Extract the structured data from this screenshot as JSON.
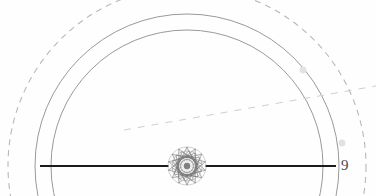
{
  "page": {
    "width": 376,
    "height": 196,
    "background_color": "#fefefe",
    "page_number": "9",
    "page_number_position": {
      "x": 341,
      "y": 158
    },
    "page_number_color": "#4a4a4a"
  },
  "figure": {
    "name": "concentric-circle-geometric-construction",
    "center": {
      "x": 187,
      "y": 166
    },
    "colors": {
      "dashed_outer": "#b8b8b8",
      "solid_mid": "#8d8d8d",
      "solid_inner": "#8d8d8d",
      "diameter_line": "#1c1c1c",
      "dashed_diagonal": "#cfcfcf",
      "rosette": "#6b6b6b",
      "faint_dot": "#e2e2e2"
    },
    "circles": [
      {
        "name": "outer-dashed-circle",
        "style": "dashed",
        "radius": 179,
        "stroke_width": 1.1,
        "dash_pattern": "6 5",
        "color": "#b8b8b8"
      },
      {
        "name": "middle-solid-circle",
        "style": "solid",
        "radius": 152,
        "stroke_width": 0.9,
        "color": "#8d8d8d"
      },
      {
        "name": "inner-solid-circle",
        "style": "solid",
        "radius": 136,
        "stroke_width": 0.9,
        "color": "#8d8d8d"
      }
    ],
    "diameter_line": {
      "name": "horizontal-diameter-line",
      "x1": 40,
      "y1": 166,
      "x2": 336,
      "y2": 166,
      "stroke_width": 1.8,
      "color": "#1c1c1c"
    },
    "diagonal_line": {
      "name": "dashed-diagonal-chord",
      "x1": 124,
      "y1": 130,
      "x2": 376,
      "y2": 86,
      "stroke_width": 1.0,
      "dash_pattern": "7 7",
      "color": "#cfcfcf"
    },
    "rosette": {
      "name": "central-star-rosette",
      "center": {
        "x": 187,
        "y": 166
      },
      "outer_radius": 19,
      "points": 14,
      "rings": 4,
      "color": "#6b6b6b"
    },
    "faint_dots": [
      {
        "name": "faint-dot-upper-right",
        "x": 303,
        "y": 70,
        "r": 3.4
      },
      {
        "name": "faint-dot-lower-right",
        "x": 342,
        "y": 143,
        "r": 3.4
      }
    ]
  }
}
